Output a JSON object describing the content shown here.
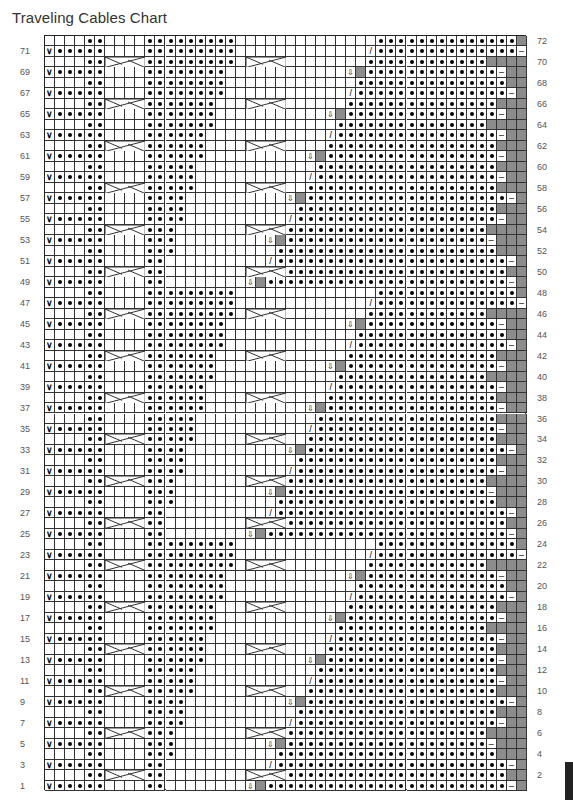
{
  "title": "Traveling Cables Chart",
  "grid": {
    "cols": 48,
    "rows": 72
  },
  "left_row_numbers": [
    "71",
    "69",
    "67",
    "65",
    "63",
    "61",
    "59",
    "57",
    "55",
    "53",
    "51",
    "49",
    "47",
    "45",
    "43",
    "41",
    "39",
    "37",
    "35",
    "33",
    "31",
    "29",
    "27",
    "25",
    "23",
    "21",
    "19",
    "17",
    "15",
    "13",
    "11",
    "9",
    "7",
    "5",
    "3",
    "1"
  ],
  "right_row_numbers": [
    "72",
    "70",
    "68",
    "66",
    "64",
    "62",
    "60",
    "58",
    "56",
    "54",
    "52",
    "50",
    "48",
    "46",
    "44",
    "42",
    "40",
    "38",
    "36",
    "34",
    "32",
    "30",
    "28",
    "26",
    "24",
    "22",
    "20",
    "18",
    "16",
    "14",
    "12",
    "10",
    "8",
    "6",
    "4",
    "2"
  ],
  "legend_symbols": {
    "empty": "knit",
    "dot": "purl",
    "v": "slip",
    "slash": "decrease",
    "arrow": "down-arrow",
    "gray": "no stitch",
    "dash": "dash",
    "cable": "cable cross"
  },
  "colors": {
    "gray": "#8c8c8c",
    "line": "#333333",
    "text": "#333333"
  }
}
